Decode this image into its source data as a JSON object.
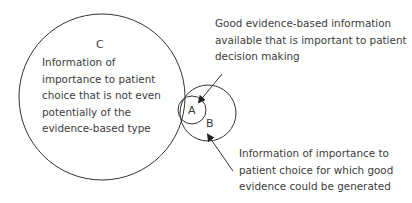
{
  "diagram": {
    "circles": [
      {
        "id": "C",
        "label": "C",
        "description": "Information of\nimportance to patient\nchoice that is not even\npotentially of the\nevidence-based type"
      },
      {
        "id": "B",
        "label": "B",
        "description": "Information of importance to\npatient choice for which good\nevidence could be generated"
      },
      {
        "id": "A",
        "label": "A",
        "description": "Good evidence-based information\navailable that is important to patient\ndecision making"
      }
    ],
    "stroke_color": "#333333"
  }
}
